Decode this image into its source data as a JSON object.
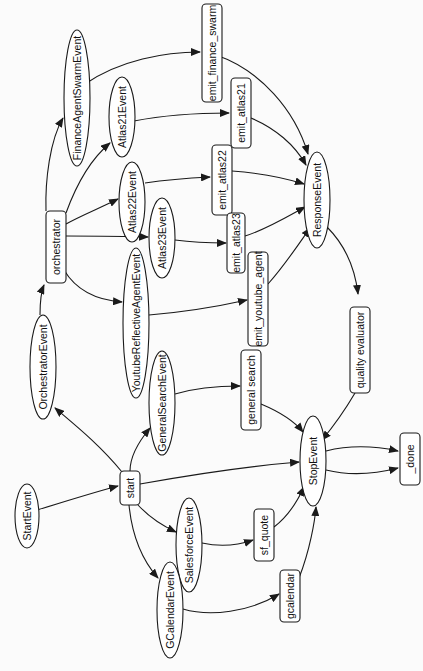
{
  "diagram": {
    "type": "workflow-graph",
    "orientation": "rotated-90-ccw",
    "colors": {
      "background": "#fbfbfb",
      "node_fill": "#ffffff",
      "stroke": "#1a1a1a",
      "text": "#111111"
    },
    "nodes": [
      {
        "id": "StartEvent",
        "label": "StartEvent",
        "shape": "ellipse",
        "cx": 27,
        "cy": 516,
        "rx": 12,
        "ry": 32
      },
      {
        "id": "start",
        "label": "start",
        "shape": "rect",
        "cx": 130,
        "cy": 488,
        "w": 20,
        "h": 34
      },
      {
        "id": "OrchestratorEvent",
        "label": "OrchestratorEvent",
        "shape": "ellipse",
        "cx": 43,
        "cy": 367,
        "rx": 13,
        "ry": 52
      },
      {
        "id": "orchestrator",
        "label": "orchestrator",
        "shape": "rect",
        "cx": 56,
        "cy": 247,
        "w": 20,
        "h": 72
      },
      {
        "id": "FinanceAgentSwarmEvent",
        "label": "FinanceAgentSwarmEvent",
        "shape": "ellipse",
        "cx": 77,
        "cy": 98,
        "rx": 13,
        "ry": 68
      },
      {
        "id": "Atlas21Event",
        "label": "Atlas21Event",
        "shape": "ellipse",
        "cx": 122,
        "cy": 117,
        "rx": 13,
        "ry": 40
      },
      {
        "id": "Atlas22Event",
        "label": "Atlas22Event",
        "shape": "ellipse",
        "cx": 132,
        "cy": 202,
        "rx": 13,
        "ry": 40
      },
      {
        "id": "Atlas23Event",
        "label": "Atlas23Event",
        "shape": "ellipse",
        "cx": 162,
        "cy": 238,
        "rx": 13,
        "ry": 40
      },
      {
        "id": "YoutubeReflectiveAgentEvent",
        "label": "YoutubeReflectiveAgentEvent",
        "shape": "ellipse",
        "cx": 136,
        "cy": 323,
        "rx": 13,
        "ry": 75
      },
      {
        "id": "GeneralSearchEvent",
        "label": "GeneralSearchEvent",
        "shape": "ellipse",
        "cx": 162,
        "cy": 403,
        "rx": 13,
        "ry": 52
      },
      {
        "id": "SalesforceEvent",
        "label": "SalesforceEvent",
        "shape": "ellipse",
        "cx": 189,
        "cy": 545,
        "rx": 13,
        "ry": 47
      },
      {
        "id": "GCalendarEvent",
        "label": "GCalendarEvent",
        "shape": "ellipse",
        "cx": 170,
        "cy": 610,
        "rx": 13,
        "ry": 48
      },
      {
        "id": "emit_finance_swarm",
        "label": "emit_finance_swarm",
        "shape": "rect",
        "cx": 212,
        "cy": 53,
        "w": 20,
        "h": 98
      },
      {
        "id": "emit_atlas21",
        "label": "emit_atlas21",
        "shape": "rect",
        "cx": 241,
        "cy": 113,
        "w": 20,
        "h": 70
      },
      {
        "id": "emit_atlas22",
        "label": "emit_atlas22",
        "shape": "rect",
        "cx": 222,
        "cy": 180,
        "w": 20,
        "h": 70
      },
      {
        "id": "emit_atlas23",
        "label": "emit_atlas23",
        "shape": "rect",
        "cx": 236,
        "cy": 243,
        "w": 18,
        "h": 60
      },
      {
        "id": "emit_youtube_agent",
        "label": "emit_youtube_agent",
        "shape": "rect",
        "cx": 258,
        "cy": 299,
        "w": 20,
        "h": 94
      },
      {
        "id": "general_search",
        "label": "general search",
        "shape": "rect",
        "cx": 251,
        "cy": 390,
        "w": 20,
        "h": 80
      },
      {
        "id": "sf_quote",
        "label": "sf_quote",
        "shape": "rect",
        "cx": 264,
        "cy": 535,
        "w": 20,
        "h": 52
      },
      {
        "id": "gcalendar",
        "label": "gcalendar",
        "shape": "rect",
        "cx": 290,
        "cy": 596,
        "w": 20,
        "h": 52
      },
      {
        "id": "ResponseEvent",
        "label": "ResponseEvent",
        "shape": "ellipse",
        "cx": 317,
        "cy": 200,
        "rx": 13,
        "ry": 48
      },
      {
        "id": "quality_evaluator",
        "label": "quality evaluator",
        "shape": "rect",
        "cx": 360,
        "cy": 350,
        "w": 20,
        "h": 86
      },
      {
        "id": "StopEvent",
        "label": "StopEvent",
        "shape": "ellipse",
        "cx": 313,
        "cy": 461,
        "rx": 13,
        "ry": 45
      },
      {
        "id": "_done",
        "label": "_done",
        "shape": "rect",
        "cx": 410,
        "cy": 459,
        "w": 20,
        "h": 52
      }
    ],
    "edges": [
      {
        "from": "StartEvent",
        "to": "start",
        "d": "M 37 510 C 70 500, 95 492, 118 486"
      },
      {
        "from": "start",
        "to": "OrchestratorEvent",
        "d": "M 122 472 C 100 445, 75 425, 55 408"
      },
      {
        "from": "OrchestratorEvent",
        "to": "orchestrator",
        "d": "M 40 315 C 40 300, 41 292, 44 285"
      },
      {
        "from": "orchestrator",
        "to": "FinanceAgentSwarmEvent",
        "d": "M 46 211 C 45 180, 50 140, 63 118"
      },
      {
        "from": "orchestrator",
        "to": "Atlas21Event",
        "d": "M 66 213 C 78 180, 92 158, 110 143"
      },
      {
        "from": "orchestrator",
        "to": "Atlas22Event",
        "d": "M 66 224 C 80 216, 100 208, 118 199"
      },
      {
        "from": "orchestrator",
        "to": "Atlas23Event",
        "d": "M 66 236 C 90 236, 120 236, 148 237"
      },
      {
        "from": "orchestrator",
        "to": "YoutubeReflectiveAgentEvent",
        "d": "M 64 270 C 76 290, 95 300, 122 302"
      },
      {
        "from": "FinanceAgentSwarmEvent",
        "to": "emit_finance_swarm",
        "d": "M 85 84 C 120 60, 165 52, 200 52"
      },
      {
        "from": "Atlas21Event",
        "to": "emit_atlas21",
        "d": "M 134 121 C 165 115, 200 113, 229 113"
      },
      {
        "from": "Atlas22Event",
        "to": "emit_atlas22",
        "d": "M 145 183 C 165 180, 190 178, 210 177"
      },
      {
        "from": "Atlas23Event",
        "to": "emit_atlas23",
        "d": "M 175 240 C 190 242, 210 243, 226 243"
      },
      {
        "from": "YoutubeReflectiveAgentEvent",
        "to": "emit_youtube_agent",
        "d": "M 149 315 C 185 312, 220 306, 247 300"
      },
      {
        "from": "emit_finance_swarm",
        "to": "ResponseEvent",
        "d": "M 216 55 C 260 70, 295 110, 308 154"
      },
      {
        "from": "emit_atlas21",
        "to": "ResponseEvent",
        "d": "M 251 118 C 275 128, 295 145, 306 165"
      },
      {
        "from": "emit_atlas22",
        "to": "ResponseEvent",
        "d": "M 232 171 C 260 173, 285 178, 304 184"
      },
      {
        "from": "emit_atlas23",
        "to": "ResponseEvent",
        "d": "M 245 236 C 265 230, 285 218, 305 207"
      },
      {
        "from": "emit_youtube_agent",
        "to": "ResponseEvent",
        "d": "M 268 284 C 285 265, 298 245, 310 228"
      },
      {
        "from": "ResponseEvent",
        "to": "quality_evaluator",
        "d": "M 327 227 C 345 245, 355 268, 358 294"
      },
      {
        "from": "quality_evaluator",
        "to": "StopEvent",
        "d": "M 355 393 C 345 410, 332 428, 322 440"
      },
      {
        "from": "start",
        "to": "GeneralSearchEvent",
        "d": "M 130 471 C 130 455, 140 440, 150 428"
      },
      {
        "from": "GeneralSearchEvent",
        "to": "general_search",
        "d": "M 175 394 C 195 388, 220 386, 240 386"
      },
      {
        "from": "general_search",
        "to": "StopEvent",
        "d": "M 261 404 C 280 412, 295 422, 303 432"
      },
      {
        "from": "start",
        "to": "StopEvent",
        "d": "M 140 484 C 190 475, 250 466, 299 462"
      },
      {
        "from": "start",
        "to": "SalesforceEvent",
        "d": "M 138 505 C 150 518, 163 526, 176 532"
      },
      {
        "from": "start",
        "to": "GCalendarEvent",
        "d": "M 129 505 C 132 535, 142 560, 158 578"
      },
      {
        "from": "SalesforceEvent",
        "to": "sf_quote",
        "d": "M 202 543 C 220 547, 236 546, 253 540"
      },
      {
        "from": "GCalendarEvent",
        "to": "gcalendar",
        "d": "M 183 609 C 210 617, 250 612, 279 594"
      },
      {
        "from": "sf_quote",
        "to": "StopEvent",
        "d": "M 274 527 C 290 515, 298 500, 304 487"
      },
      {
        "from": "gcalendar",
        "to": "StopEvent",
        "d": "M 299 578 C 310 550, 315 520, 316 507"
      },
      {
        "from": "StopEvent",
        "to": "_done",
        "d": "M 326 451 C 350 445, 375 446, 398 451"
      },
      {
        "from": "StopEvent",
        "to": "_done",
        "d": "M 326 470 C 350 476, 375 474, 398 468"
      }
    ]
  }
}
